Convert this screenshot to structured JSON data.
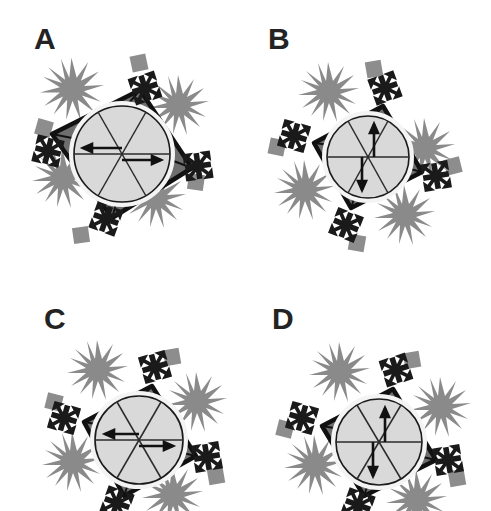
{
  "figure": {
    "kind": "multi-panel-schematic-diagram",
    "panel_count": 4,
    "background_color": "#ffffff",
    "palette": {
      "outline_black": "#111111",
      "shell_dark_gray": "#6e6e6e",
      "core_light_gray": "#d9d9d9",
      "decoration_gray": "#8a8a8a",
      "square_gray": "#8d8d8d",
      "label_color": "#232323"
    },
    "panels": [
      {
        "id": "A",
        "label": "A",
        "arrow_orientation": "horizontal",
        "arrow_count": 2,
        "arrow_directions": [
          "left",
          "right"
        ],
        "spoke_count": 6,
        "corner_glyph_count": 4,
        "corner_glyph_name": "four-way-arrow-cross",
        "square_count": 4,
        "starburst_count": 4,
        "shell_shape": "rotated-square",
        "core_shape": "circle"
      },
      {
        "id": "B",
        "label": "B",
        "arrow_orientation": "vertical",
        "arrow_count": 2,
        "arrow_directions": [
          "up",
          "down"
        ],
        "spoke_count": 6,
        "corner_glyph_count": 4,
        "corner_glyph_name": "four-way-arrow-cross",
        "square_count": 4,
        "starburst_count": 4,
        "shell_shape": "rotated-square",
        "core_shape": "circle"
      },
      {
        "id": "C",
        "label": "C",
        "arrow_orientation": "horizontal",
        "arrow_count": 2,
        "arrow_directions": [
          "left",
          "right"
        ],
        "spoke_count": 6,
        "corner_glyph_count": 4,
        "corner_glyph_name": "four-way-arrow-cross",
        "square_count": 4,
        "starburst_count": 4,
        "shell_shape": "rotated-square",
        "core_shape": "circle",
        "cropped": "bottom"
      },
      {
        "id": "D",
        "label": "D",
        "arrow_orientation": "vertical",
        "arrow_count": 2,
        "arrow_directions": [
          "up",
          "down"
        ],
        "spoke_count": 6,
        "corner_glyph_count": 4,
        "corner_glyph_name": "four-way-arrow-cross",
        "square_count": 4,
        "starburst_count": 4,
        "shell_shape": "rotated-square",
        "core_shape": "circle",
        "cropped": "bottom"
      }
    ]
  }
}
